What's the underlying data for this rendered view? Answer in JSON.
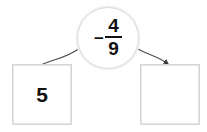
{
  "widget": {
    "name": "fraction-number-line-step",
    "background_color": "#ffffff",
    "text_color": "#111111",
    "border_color": "#d9d9d9"
  },
  "operation_circle": {
    "sign": "−",
    "numerator": "4",
    "denominator": "9",
    "full_value": "− 4/9"
  },
  "boxes": {
    "left": {
      "value": "5",
      "is_empty": false
    },
    "right": {
      "value": "",
      "is_empty": true
    }
  },
  "arrows": {
    "left": {
      "label": "arrow-circle-to-left-box",
      "has_arrowhead": false,
      "direction": "from-circle-down-left"
    },
    "right": {
      "label": "arrow-circle-to-right-box",
      "has_arrowhead": true,
      "direction": "from-circle-down-right"
    }
  }
}
